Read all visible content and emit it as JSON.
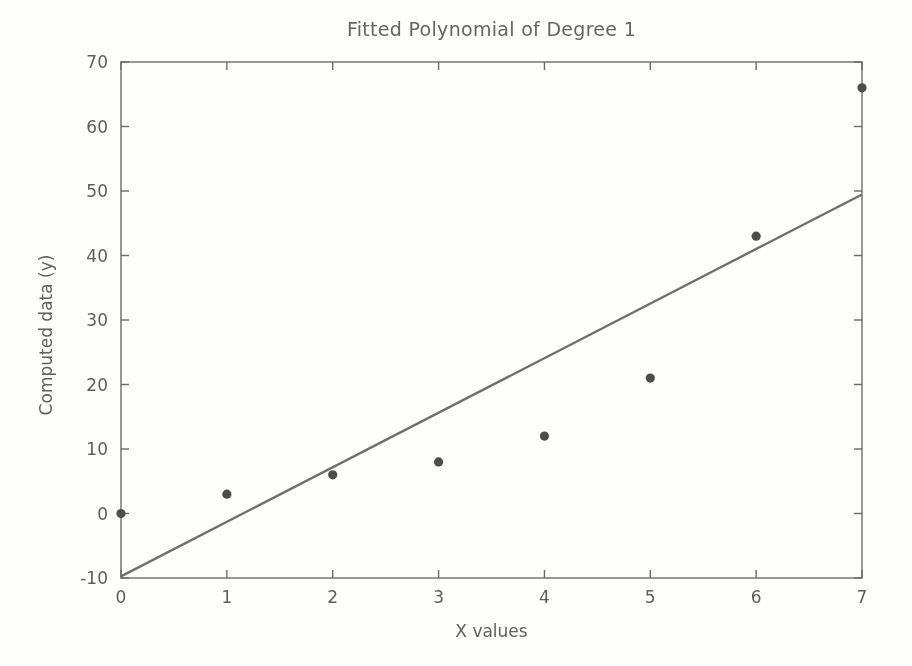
{
  "chart_data": {
    "type": "scatter",
    "title": "Fitted Polynomial of Degree 1",
    "xlabel": "X values",
    "ylabel": "Computed data (y)",
    "x": [
      0,
      1,
      2,
      3,
      4,
      5,
      6,
      7
    ],
    "y": [
      0,
      3,
      6,
      8,
      12,
      21,
      43,
      66
    ],
    "series": [
      {
        "name": "computed-data-points",
        "type": "scatter",
        "x": [
          0,
          1,
          2,
          3,
          4,
          5,
          6,
          7
        ],
        "y": [
          0,
          3,
          6,
          8,
          12,
          21,
          43,
          66
        ]
      },
      {
        "name": "degree-1-fit-line",
        "type": "line",
        "slope": 8.46,
        "intercept": -9.75,
        "x_start": 0,
        "x_end": 7
      }
    ],
    "xlim": [
      0,
      7
    ],
    "ylim": [
      -10,
      70
    ],
    "xticks": [
      0,
      1,
      2,
      3,
      4,
      5,
      6,
      7
    ],
    "yticks": [
      -10,
      0,
      10,
      20,
      30,
      40,
      50,
      60,
      70
    ],
    "grid": false,
    "legend": "none",
    "style": {
      "background": "#fdfdfc",
      "frame_color": "#6b6b6b",
      "tick_color": "#6b6b6b",
      "text_color": "#5e5e5e",
      "title_color": "#666565",
      "point_color": "#4d4d4d",
      "line_color": "#6e6e6e",
      "point_radius": 4.6,
      "tick_length": 8,
      "ticks_mirrored_inward": true
    }
  }
}
